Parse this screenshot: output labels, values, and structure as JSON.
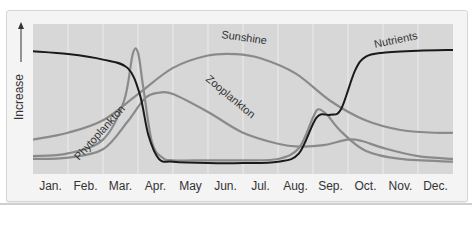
{
  "chart_data": {
    "type": "line",
    "title": "",
    "xlabel": "",
    "ylabel": "Increase",
    "categories": [
      "Jan.",
      "Feb.",
      "Mar.",
      "Apr.",
      "May",
      "Jun.",
      "Jul.",
      "Aug.",
      "Sep.",
      "Oct.",
      "Nov.",
      "Dec."
    ],
    "grid": true,
    "legend": "inline labels on curves",
    "x_unit": "month (0 = start Jan, 12 = end Dec)",
    "y_range": [
      0,
      100
    ],
    "series": [
      {
        "name": "Nutrients",
        "color": "#1a1a1a",
        "points": [
          [
            0,
            86
          ],
          [
            1,
            84
          ],
          [
            2,
            80
          ],
          [
            2.7,
            74
          ],
          [
            3.05,
            55
          ],
          [
            3.3,
            25
          ],
          [
            3.6,
            8
          ],
          [
            4,
            6
          ],
          [
            5,
            5
          ],
          [
            6,
            5
          ],
          [
            7,
            6
          ],
          [
            7.6,
            12
          ],
          [
            8.1,
            38
          ],
          [
            8.5,
            40
          ],
          [
            8.8,
            44
          ],
          [
            9.2,
            72
          ],
          [
            9.5,
            82
          ],
          [
            10,
            85
          ],
          [
            11,
            86.5
          ],
          [
            12,
            87
          ]
        ]
      },
      {
        "name": "Phytoplankton",
        "color": "#8a8a8a",
        "points": [
          [
            0,
            10
          ],
          [
            1,
            12
          ],
          [
            2,
            22
          ],
          [
            2.6,
            50
          ],
          [
            2.85,
            84
          ],
          [
            3.0,
            85
          ],
          [
            3.15,
            60
          ],
          [
            3.4,
            20
          ],
          [
            3.7,
            9
          ],
          [
            4,
            7
          ],
          [
            5,
            7
          ],
          [
            6,
            7
          ],
          [
            7,
            8
          ],
          [
            7.6,
            16
          ],
          [
            8.0,
            38
          ],
          [
            8.15,
            44
          ],
          [
            8.4,
            40
          ],
          [
            8.8,
            28
          ],
          [
            9.5,
            14
          ],
          [
            10.5,
            8
          ],
          [
            12,
            6
          ]
        ]
      },
      {
        "name": "Zooplankton",
        "color": "#8a8a8a",
        "points": [
          [
            0,
            8
          ],
          [
            1,
            9
          ],
          [
            2,
            15
          ],
          [
            2.7,
            35
          ],
          [
            3.2,
            52
          ],
          [
            3.6,
            56
          ],
          [
            4,
            55
          ],
          [
            5,
            42
          ],
          [
            6,
            27
          ],
          [
            7,
            19
          ],
          [
            7.6,
            17
          ],
          [
            8.3,
            18
          ],
          [
            9.0,
            22
          ],
          [
            9.4,
            21
          ],
          [
            10,
            16
          ],
          [
            11,
            10
          ],
          [
            12,
            8
          ]
        ]
      },
      {
        "name": "Sunshine",
        "color": "#8a8a8a",
        "points": [
          [
            0,
            22
          ],
          [
            1,
            27
          ],
          [
            2,
            36
          ],
          [
            3,
            55
          ],
          [
            4,
            74
          ],
          [
            5,
            83
          ],
          [
            5.8,
            84
          ],
          [
            6.5,
            81
          ],
          [
            7.5,
            70
          ],
          [
            8.5,
            50
          ],
          [
            9.5,
            36
          ],
          [
            10.5,
            29
          ],
          [
            11.5,
            27
          ],
          [
            12,
            27
          ]
        ]
      }
    ],
    "annotations": [
      {
        "text": "Nutrients",
        "near": "Oct.-Nov.",
        "y": 90
      },
      {
        "text": "Sunshine",
        "near": "Jun.",
        "y": 88
      },
      {
        "text": "Zooplankton",
        "near": "May-Jun.",
        "y": 40,
        "rotated": true
      },
      {
        "text": "Phytoplankton",
        "near": "Feb.-Mar.",
        "y": 25,
        "rotated": true
      }
    ]
  },
  "axis": {
    "y_label": "Increase",
    "months": [
      "Jan.",
      "Feb.",
      "Mar.",
      "Apr.",
      "May",
      "Jun.",
      "Jul.",
      "Aug.",
      "Sep.",
      "Oct.",
      "Nov.",
      "Dec."
    ]
  }
}
